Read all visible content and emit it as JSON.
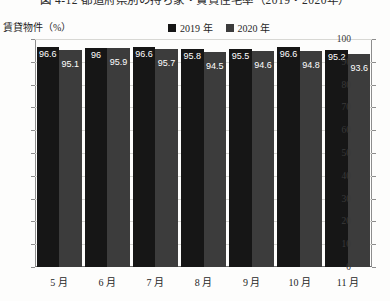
{
  "title": "図 4-12 都道府県別の持ち家・賃貸住宅率（2019・2020年）",
  "ylabel": "賃貸物件（%）",
  "legend": [
    {
      "label": "2019 年",
      "color": "#161616"
    },
    {
      "label": "2020 年",
      "color": "#3c3c3c"
    }
  ],
  "colors": {
    "series_2019": "#161616",
    "series_2020": "#3c3c3c",
    "gridline": "#d8d8d4",
    "axis": "#6f6f6f",
    "background": "#fdfdfc",
    "label_text": "#ffffff"
  },
  "chart_data": {
    "type": "bar",
    "title": "図 4-12 都道府県別の持ち家・賃貸住宅率（2019・2020年）",
    "xlabel": "",
    "ylabel": "賃貸物件（%）",
    "categories": [
      "5 月",
      "6 月",
      "7 月",
      "8 月",
      "9 月",
      "10 月",
      "11 月"
    ],
    "series": [
      {
        "name": "2019 年",
        "color": "#161616",
        "values": [
          96.6,
          96,
          96.6,
          95.8,
          95.5,
          96.6,
          95.2
        ]
      },
      {
        "name": "2020 年",
        "color": "#3c3c3c",
        "values": [
          95.1,
          95.9,
          95.7,
          94.5,
          94.6,
          94.8,
          93.6
        ]
      }
    ],
    "ylim": [
      0,
      100
    ],
    "yticks": [
      0,
      10,
      20,
      30,
      40,
      50,
      60,
      70,
      80,
      90,
      100
    ],
    "grid": true,
    "legend_position": "top-center"
  }
}
